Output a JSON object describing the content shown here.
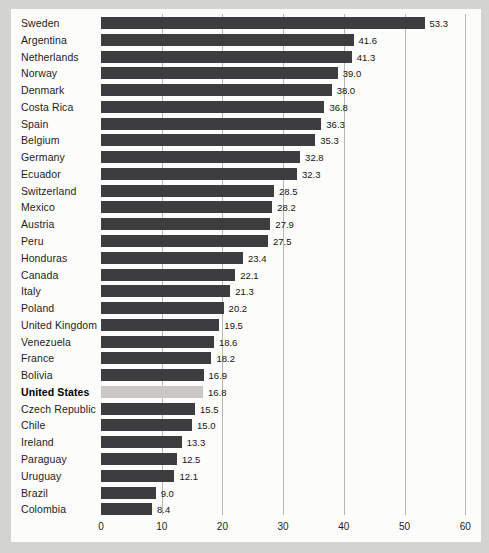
{
  "chart_data": {
    "type": "bar",
    "orientation": "horizontal",
    "title": "",
    "xlabel": "",
    "ylabel": "",
    "xlim": [
      0,
      60
    ],
    "grid": true,
    "x_ticks": [
      "0",
      "10",
      "20",
      "30",
      "40",
      "50",
      "60"
    ],
    "x_tick_values": [
      0,
      10,
      20,
      30,
      40,
      50,
      60
    ],
    "categories": [
      "Sweden",
      "Argentina",
      "Netherlands",
      "Norway",
      "Denmark",
      "Costa Rica",
      "Spain",
      "Belgium",
      "Germany",
      "Ecuador",
      "Switzerland",
      "Mexico",
      "Austria",
      "Peru",
      "Honduras",
      "Canada",
      "Italy",
      "Poland",
      "United Kingdom",
      "Venezuela",
      "France",
      "Bolivia",
      "United States",
      "Czech Republic",
      "Chile",
      "Ireland",
      "Paraguay",
      "Uruguay",
      "Brazil",
      "Colombia"
    ],
    "values": [
      53.3,
      41.6,
      41.3,
      39.0,
      38.0,
      36.8,
      36.3,
      35.3,
      32.8,
      32.3,
      28.5,
      28.2,
      27.9,
      27.5,
      23.4,
      22.1,
      21.3,
      20.2,
      19.5,
      18.6,
      18.2,
      16.9,
      16.8,
      15.5,
      15.0,
      13.3,
      12.5,
      12.1,
      9.0,
      8.4
    ],
    "value_labels": [
      "53.3",
      "41.6",
      "41.3",
      "39.0",
      "38.0",
      "36.8",
      "36.3",
      "35.3",
      "32.8",
      "32.3",
      "28.5",
      "28.2",
      "27.9",
      "27.5",
      "23.4",
      "22.1",
      "21.3",
      "20.2",
      "19.5",
      "18.6",
      "18.2",
      "16.9",
      "16.8",
      "15.5",
      "15.0",
      "13.3",
      "12.5",
      "12.1",
      "9.0",
      "8.4"
    ],
    "highlight_category": "United States",
    "highlight_index": 22,
    "legend": null,
    "colors": {
      "bar": "#3d3d3f",
      "highlight_bar": "#c9c8c4",
      "gridline": "#b6b6b4",
      "panel_background": "#fcfcfa",
      "page_background": "#d3d4cf",
      "text": "#1c1c1c"
    }
  }
}
